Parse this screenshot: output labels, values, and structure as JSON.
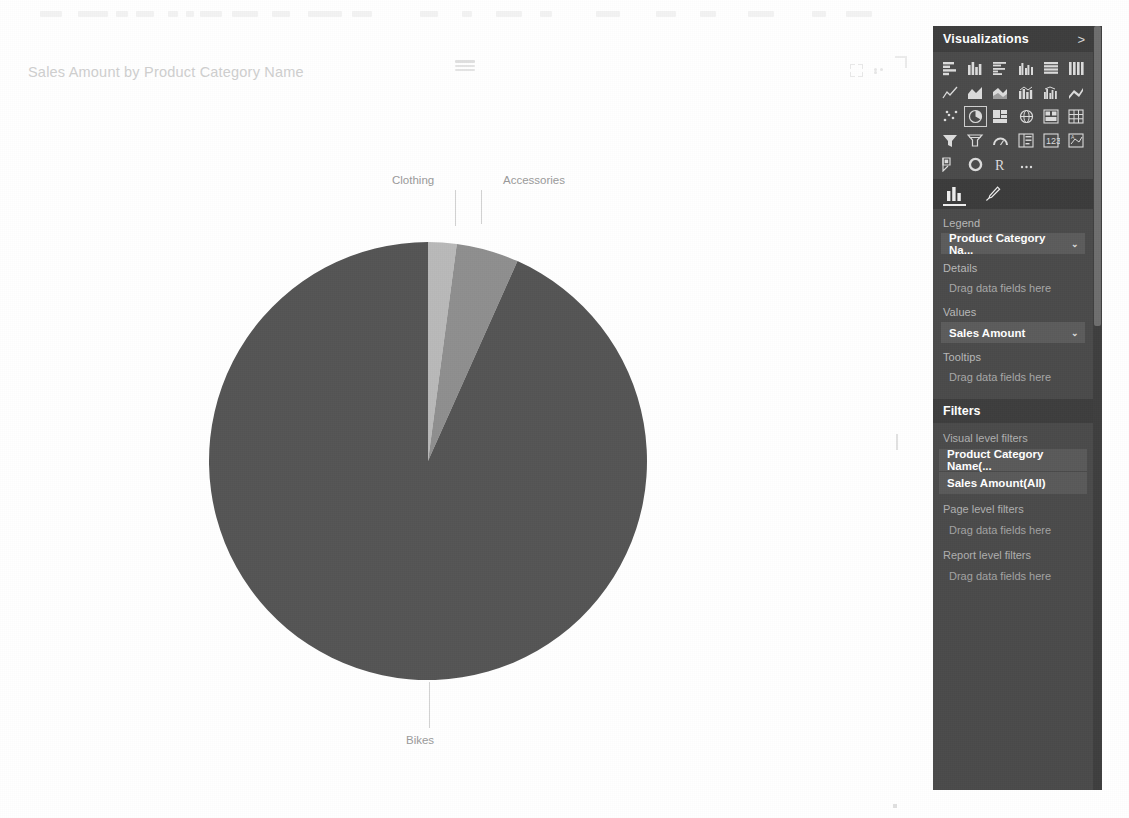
{
  "visual": {
    "title": "Sales Amount by Product Category Name",
    "drag_handle": "drag-handle",
    "focus_icon": "focus-mode-icon",
    "more_icon": "more-options-icon"
  },
  "chart_data": {
    "type": "pie",
    "title": "Sales Amount by Product Category Name",
    "xlabel": "",
    "ylabel": "",
    "legend": "Product Category Name",
    "value_field": "Sales Amount",
    "categories": [
      "Clothing",
      "Accessories",
      "Bikes"
    ],
    "values": [
      2.1,
      4.6,
      93.3
    ],
    "value_unit": "percent",
    "labels": [
      "Clothing",
      "Accessories",
      "Bikes"
    ],
    "colors": [
      "#b9b9b9",
      "#8f8f8f",
      "#555555"
    ],
    "start_angle_deg": 0,
    "direction": "clockwise",
    "grid": false,
    "legend_position": "none",
    "data_labels": "category-name-callouts"
  },
  "viz_pane": {
    "header": "Visualizations",
    "collapse_chevron": ">",
    "icons": [
      "stacked-bar-chart-icon",
      "stacked-column-chart-icon",
      "clustered-bar-chart-icon",
      "clustered-column-chart-icon",
      "hundred-percent-stacked-bar-icon",
      "hundred-percent-stacked-column-icon",
      "line-chart-icon",
      "area-chart-icon",
      "stacked-area-chart-icon",
      "line-stacked-column-chart-icon",
      "line-clustered-column-chart-icon",
      "ribbon-chart-icon",
      "scatter-chart-icon",
      "pie-chart-icon",
      "treemap-icon",
      "map-icon",
      "filled-map-icon",
      "matrix-icon",
      "funnel-icon",
      "gauge-icon",
      "arc-gauge-icon",
      "card-icon",
      "multi-row-card-icon",
      "kpi-icon",
      "slicer-icon",
      "donut-chart-icon",
      "r-script-visual-icon",
      "more-visuals-icon"
    ],
    "tabs": [
      {
        "name": "fields-tab",
        "icon": "bar-chart-icon",
        "active": true
      },
      {
        "name": "format-tab",
        "icon": "paintbrush-icon",
        "active": false
      }
    ],
    "wells": [
      {
        "label": "Legend",
        "chip": "Product Category Na...",
        "chip_caret": "⌄",
        "placeholder": null
      },
      {
        "label": "Details",
        "chip": null,
        "placeholder": "Drag data fields here"
      },
      {
        "label": "Values",
        "chip": "Sales Amount",
        "chip_caret": "⌄",
        "placeholder": null
      },
      {
        "label": "Tooltips",
        "chip": null,
        "placeholder": "Drag data fields here"
      }
    ]
  },
  "filters_pane": {
    "header": "Filters",
    "groups": [
      {
        "label": "Visual level filters",
        "items": [
          "Product Category Name(...",
          "Sales Amount(All)"
        ],
        "placeholder": null
      },
      {
        "label": "Page level filters",
        "items": [],
        "placeholder": "Drag data fields here"
      },
      {
        "label": "Report level filters",
        "items": [],
        "placeholder": "Drag data fields here"
      }
    ]
  }
}
